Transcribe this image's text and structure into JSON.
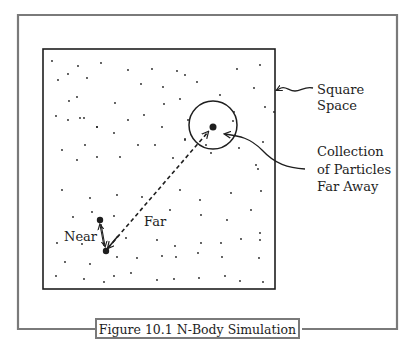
{
  "figure": {
    "caption": "Figure 10.1   N-Body Simulation",
    "frame_color": "#7a7a7a",
    "ink_color": "#1e1e1e"
  },
  "labels": {
    "square_space_line1": "Square",
    "square_space_line2": "Space",
    "collection_line1": "Collection",
    "collection_line2": "of Particles",
    "collection_line3": "Far Away",
    "near": "Near",
    "far": "Far"
  },
  "space": {
    "x": 43,
    "y": 49,
    "width": 232,
    "height": 240
  },
  "cluster": {
    "cx": 213,
    "cy": 125,
    "r": 24,
    "center_particle": {
      "x": 213,
      "y": 127,
      "r": 3.5
    }
  },
  "near_pair": {
    "a": {
      "x": 100,
      "y": 220,
      "r": 3.2
    },
    "b": {
      "x": 106,
      "y": 251,
      "r": 3.2
    }
  },
  "particles": [
    [
      52,
      61
    ],
    [
      68,
      74
    ],
    [
      78,
      66
    ],
    [
      101,
      63
    ],
    [
      128,
      70
    ],
    [
      152,
      69
    ],
    [
      177,
      71
    ],
    [
      185,
      75
    ],
    [
      58,
      80
    ],
    [
      87,
      78
    ],
    [
      141,
      84
    ],
    [
      163,
      87
    ],
    [
      197,
      82
    ],
    [
      237,
      69
    ],
    [
      260,
      65
    ],
    [
      254,
      88
    ],
    [
      69,
      101
    ],
    [
      77,
      97
    ],
    [
      115,
      103
    ],
    [
      164,
      104
    ],
    [
      180,
      99
    ],
    [
      220,
      95
    ],
    [
      234,
      112
    ],
    [
      265,
      107
    ],
    [
      56,
      116
    ],
    [
      68,
      120
    ],
    [
      80,
      118
    ],
    [
      84,
      118
    ],
    [
      97,
      127
    ],
    [
      128,
      120
    ],
    [
      144,
      115
    ],
    [
      162,
      127
    ],
    [
      185,
      139
    ],
    [
      97,
      127
    ],
    [
      114,
      133
    ],
    [
      188,
      120
    ],
    [
      233,
      121
    ],
    [
      274,
      112
    ],
    [
      62,
      150
    ],
    [
      85,
      145
    ],
    [
      138,
      145
    ],
    [
      155,
      145
    ],
    [
      185,
      140
    ],
    [
      206,
      145
    ],
    [
      239,
      148
    ],
    [
      263,
      142
    ],
    [
      77,
      160
    ],
    [
      97,
      157
    ],
    [
      120,
      157
    ],
    [
      173,
      158
    ],
    [
      211,
      153
    ],
    [
      256,
      165
    ],
    [
      258,
      169
    ],
    [
      62,
      190
    ],
    [
      90,
      198
    ],
    [
      117,
      195
    ],
    [
      142,
      197
    ],
    [
      180,
      190
    ],
    [
      200,
      200
    ],
    [
      231,
      193
    ],
    [
      261,
      191
    ],
    [
      73,
      217
    ],
    [
      92,
      212
    ],
    [
      114,
      216
    ],
    [
      170,
      210
    ],
    [
      201,
      215
    ],
    [
      227,
      220
    ],
    [
      251,
      210
    ],
    [
      260,
      233
    ],
    [
      57,
      243
    ],
    [
      82,
      244
    ],
    [
      126,
      238
    ],
    [
      157,
      240
    ],
    [
      175,
      246
    ],
    [
      201,
      243
    ],
    [
      221,
      243
    ],
    [
      241,
      239
    ],
    [
      260,
      240
    ],
    [
      65,
      262
    ],
    [
      90,
      264
    ],
    [
      117,
      257
    ],
    [
      137,
      258
    ],
    [
      162,
      256
    ],
    [
      176,
      257
    ],
    [
      198,
      253
    ],
    [
      222,
      257
    ],
    [
      259,
      258
    ],
    [
      56,
      276
    ],
    [
      84,
      279
    ],
    [
      104,
      282
    ],
    [
      114,
      276
    ],
    [
      131,
      273
    ],
    [
      157,
      280
    ],
    [
      174,
      279
    ],
    [
      199,
      278
    ],
    [
      225,
      276
    ],
    [
      240,
      281
    ],
    [
      263,
      282
    ]
  ]
}
